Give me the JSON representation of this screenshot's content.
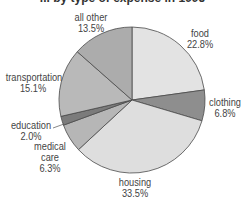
{
  "chart_data": {
    "type": "pie",
    "title": "... by type of expense in 1995",
    "title_clipped": true,
    "start_angle_deg": 0,
    "direction": "clockwise",
    "center": [
      132,
      100
    ],
    "radius": 73,
    "categories": [
      "food",
      "clothing",
      "housing",
      "medical care",
      "education",
      "transportation",
      "all other"
    ],
    "values": [
      22.8,
      6.8,
      33.5,
      6.3,
      2.0,
      15.1,
      13.5
    ],
    "unit": "%",
    "slices": [
      {
        "label": "food",
        "value": 22.8,
        "value_label": "22.8%",
        "color": "#e3e3e3"
      },
      {
        "label": "clothing",
        "value": 6.8,
        "value_label": "6.8%",
        "color": "#8e8e8e"
      },
      {
        "label": "housing",
        "value": 33.5,
        "value_label": "33.5%",
        "color": "#dedede"
      },
      {
        "label": "medical care",
        "value": 6.3,
        "value_label": "6.3%",
        "color": "#b6b6b6"
      },
      {
        "label": "education",
        "value": 2.0,
        "value_label": "2.0%",
        "color": "#7b7b7b"
      },
      {
        "label": "transportation",
        "value": 15.1,
        "value_label": "15.1%",
        "color": "#b9b9b9"
      },
      {
        "label": "all other",
        "value": 13.5,
        "value_label": "13.5%",
        "color": "#acacac"
      }
    ],
    "legend": "none (direct labels)"
  },
  "labels": {
    "food": {
      "name": "food",
      "pct": "22.8%"
    },
    "clothing": {
      "name": "clothing",
      "pct": "6.8%"
    },
    "housing": {
      "name": "housing",
      "pct": "33.5%"
    },
    "medical": {
      "name1": "medical",
      "name2": "care",
      "pct": "6.3%"
    },
    "education": {
      "name": "education",
      "pct": "2.0%"
    },
    "transportation": {
      "name": "transportation",
      "pct": "15.1%"
    },
    "all_other": {
      "name": "all other",
      "pct": "13.5%"
    }
  },
  "title": "... by type of expense in 1995"
}
